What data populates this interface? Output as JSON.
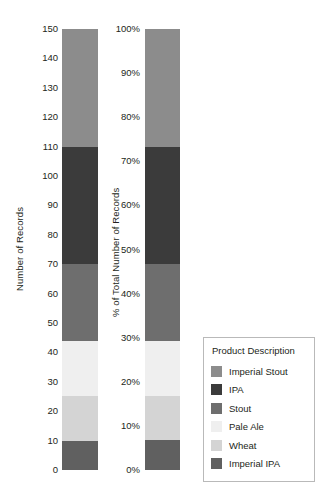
{
  "chart_data": {
    "type": "bar",
    "title": "",
    "subtitle": "",
    "orientation": "vertical",
    "stacked": true,
    "grid": false,
    "categories": [
      "Number of Records",
      "% of Total Number of Records"
    ],
    "legend": {
      "title": "Product Description",
      "position": "bottom-right",
      "entries": [
        {
          "name": "Imperial Stout",
          "color": "#8c8c8c"
        },
        {
          "name": "IPA",
          "color": "#3b3b3b"
        },
        {
          "name": "Stout",
          "color": "#6e6e6e"
        },
        {
          "name": "Pale Ale",
          "color": "#efefef"
        },
        {
          "name": "Wheat",
          "color": "#d4d4d4"
        },
        {
          "name": "Imperial IPA",
          "color": "#606060"
        }
      ]
    },
    "panels": [
      {
        "id": "records",
        "ylabel": "Number of Records",
        "ylim": [
          0,
          150
        ],
        "ytick_labels": [
          "0",
          "10",
          "20",
          "30",
          "40",
          "50",
          "60",
          "70",
          "80",
          "90",
          "100",
          "110",
          "120",
          "130",
          "140",
          "150"
        ],
        "ytick_values": [
          0,
          10,
          20,
          30,
          40,
          50,
          60,
          70,
          80,
          90,
          100,
          110,
          120,
          130,
          140,
          150
        ],
        "segments_bottom_to_top": [
          {
            "name": "Imperial IPA",
            "value": 10,
            "start": 0,
            "end": 10,
            "color": "#606060"
          },
          {
            "name": "Wheat",
            "value": 15,
            "start": 10,
            "end": 25,
            "color": "#d4d4d4"
          },
          {
            "name": "Pale Ale",
            "value": 19,
            "start": 25,
            "end": 44,
            "color": "#efefef"
          },
          {
            "name": "Stout",
            "value": 26,
            "start": 44,
            "end": 70,
            "color": "#6e6e6e"
          },
          {
            "name": "IPA",
            "value": 40,
            "start": 70,
            "end": 110,
            "color": "#3b3b3b"
          },
          {
            "name": "Imperial Stout",
            "value": 40,
            "start": 110,
            "end": 150,
            "color": "#8c8c8c"
          }
        ],
        "total": 150
      },
      {
        "id": "percent",
        "ylabel": "% of Total Number of Records",
        "ylim": [
          0,
          100
        ],
        "ytick_labels": [
          "0%",
          "10%",
          "20%",
          "30%",
          "40%",
          "50%",
          "60%",
          "70%",
          "80%",
          "90%",
          "100%"
        ],
        "ytick_values": [
          0,
          10,
          20,
          30,
          40,
          50,
          60,
          70,
          80,
          90,
          100
        ],
        "segments_bottom_to_top": [
          {
            "name": "Imperial IPA",
            "value": 6.7,
            "start": 0,
            "end": 6.7,
            "color": "#606060"
          },
          {
            "name": "Wheat",
            "value": 10.0,
            "start": 6.7,
            "end": 16.7,
            "color": "#d4d4d4"
          },
          {
            "name": "Pale Ale",
            "value": 12.7,
            "start": 16.7,
            "end": 29.3,
            "color": "#efefef"
          },
          {
            "name": "Stout",
            "value": 17.3,
            "start": 29.3,
            "end": 46.7,
            "color": "#6e6e6e"
          },
          {
            "name": "IPA",
            "value": 26.7,
            "start": 46.7,
            "end": 73.3,
            "color": "#3b3b3b"
          },
          {
            "name": "Imperial Stout",
            "value": 26.7,
            "start": 73.3,
            "end": 100,
            "color": "#8c8c8c"
          }
        ],
        "total": 100
      }
    ]
  }
}
